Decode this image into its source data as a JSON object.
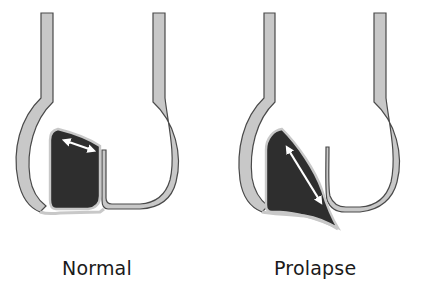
{
  "panels": [
    {
      "id": "normal",
      "label": "Normal",
      "leaflet_state": "closed",
      "arrow": "double-headed horizontal arrow across leaflet top"
    },
    {
      "id": "prolapse",
      "label": "Prolapse",
      "leaflet_state": "prolapsed",
      "arrow": "double-headed diagonal arrow along leaflet length"
    }
  ],
  "colors": {
    "wall_fill": "#c8c8c8",
    "wall_stroke": "#4a4a4a",
    "leaflet_fill": "#2e2e2e",
    "arrow": "#ffffff",
    "label": "#1a1a1a",
    "background": "#ffffff"
  }
}
